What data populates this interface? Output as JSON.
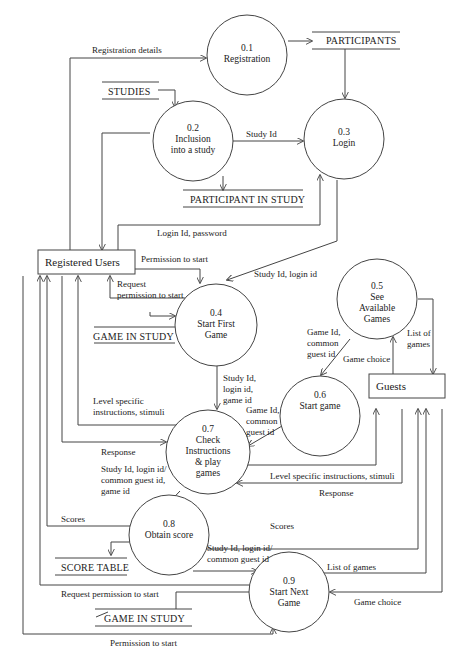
{
  "diagram": {
    "type": "data-flow-diagram",
    "processes": [
      {
        "id": "0.1",
        "lines": [
          "0.1",
          "Registration"
        ]
      },
      {
        "id": "0.2",
        "lines": [
          "0.2",
          "Inclusion",
          "into a study"
        ]
      },
      {
        "id": "0.3",
        "lines": [
          "0.3",
          "Login"
        ]
      },
      {
        "id": "0.4",
        "lines": [
          "0.4",
          "Start First",
          "Game"
        ]
      },
      {
        "id": "0.5",
        "lines": [
          "0.5",
          "See",
          "Available",
          "Games"
        ]
      },
      {
        "id": "0.6",
        "lines": [
          "0.6",
          "Start game"
        ]
      },
      {
        "id": "0.7",
        "lines": [
          "0.7",
          "Check",
          "Instructions",
          "& play",
          "games"
        ]
      },
      {
        "id": "0.8",
        "lines": [
          "0.8",
          "Obtain score"
        ]
      },
      {
        "id": "0.9",
        "lines": [
          "0.9",
          "Start Next",
          "Game"
        ]
      }
    ],
    "entities": {
      "registered_users": "Registered Users",
      "guests": "Guests"
    },
    "stores": {
      "participants": "PARTICIPANTS",
      "studies": "STUDIES",
      "participant_in_study": "PARTICIPANT IN STUDY",
      "game_in_study_1": "GAME IN STUDY",
      "score_table": "SCORE TABLE",
      "game_in_study_2": "GAME IN STUDY"
    },
    "flows": {
      "registration_details": "Registration details",
      "study_id": "Study Id",
      "login_id_password": "Login Id, password",
      "permission_to_start_1": "Permission to start",
      "request_permission_1": [
        "Request",
        "permission to start"
      ],
      "study_id_login_id": "Study Id, login id",
      "game_id_common_guest_id_1": [
        "Game Id,",
        "common",
        "guest id"
      ],
      "game_choice_1": "Game choice",
      "list_of_games_1": [
        "List of",
        "games"
      ],
      "study_login_game_id": [
        "Study Id,",
        "login id,",
        "game id"
      ],
      "game_id_common_guest_id_2": [
        "Game Id,",
        "common",
        "guest id"
      ],
      "level_specific_1": [
        "Level specific",
        "instructions, stimuli"
      ],
      "response_1": "Response",
      "level_specific_2": "Level specific instructions, stimuli",
      "response_2": "Response",
      "study_login_common_game": [
        "Study Id, login id/",
        "common guest id,",
        "game id"
      ],
      "scores_1": "Scores",
      "scores_2": "Scores",
      "study_login_common_2": [
        "Study Id, login id/",
        "common guest id"
      ],
      "list_of_games_2": "List of games",
      "request_permission_2": "Request permission to start",
      "game_choice_2": "Game choice",
      "permission_to_start_2": "Permission to start"
    }
  }
}
